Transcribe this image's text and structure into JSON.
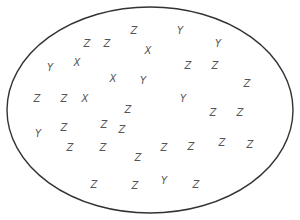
{
  "diagram": {
    "type": "set-ellipse",
    "ellipse": {
      "cx": 150,
      "cy": 110,
      "rx": 143,
      "ry": 103,
      "stroke": "#333333"
    },
    "letter_color": "#555555",
    "letters": [
      {
        "t": "Z",
        "x": 134,
        "y": 31
      },
      {
        "t": "Y",
        "x": 180,
        "y": 31
      },
      {
        "t": "Z",
        "x": 87,
        "y": 44
      },
      {
        "t": "Z",
        "x": 107,
        "y": 44
      },
      {
        "t": "X",
        "x": 148,
        "y": 51
      },
      {
        "t": "Y",
        "x": 218,
        "y": 44
      },
      {
        "t": "Y",
        "x": 50,
        "y": 68
      },
      {
        "t": "X",
        "x": 77,
        "y": 63
      },
      {
        "t": "Z",
        "x": 188,
        "y": 66
      },
      {
        "t": "Z",
        "x": 215,
        "y": 66
      },
      {
        "t": "X",
        "x": 113,
        "y": 79
      },
      {
        "t": "Y",
        "x": 143,
        "y": 81
      },
      {
        "t": "Z",
        "x": 247,
        "y": 84
      },
      {
        "t": "Z",
        "x": 37,
        "y": 99
      },
      {
        "t": "Z",
        "x": 64,
        "y": 99
      },
      {
        "t": "X",
        "x": 85,
        "y": 99
      },
      {
        "t": "Y",
        "x": 183,
        "y": 99
      },
      {
        "t": "Z",
        "x": 128,
        "y": 110
      },
      {
        "t": "Z",
        "x": 213,
        "y": 113
      },
      {
        "t": "Z",
        "x": 240,
        "y": 113
      },
      {
        "t": "Y",
        "x": 38,
        "y": 134
      },
      {
        "t": "Z",
        "x": 64,
        "y": 128
      },
      {
        "t": "Z",
        "x": 104,
        "y": 125
      },
      {
        "t": "Z",
        "x": 122,
        "y": 130
      },
      {
        "t": "Z",
        "x": 70,
        "y": 148
      },
      {
        "t": "Z",
        "x": 103,
        "y": 148
      },
      {
        "t": "Z",
        "x": 138,
        "y": 158
      },
      {
        "t": "Z",
        "x": 164,
        "y": 148
      },
      {
        "t": "Z",
        "x": 191,
        "y": 147
      },
      {
        "t": "Z",
        "x": 222,
        "y": 143
      },
      {
        "t": "Z",
        "x": 250,
        "y": 145
      },
      {
        "t": "Z",
        "x": 94,
        "y": 185
      },
      {
        "t": "Z",
        "x": 135,
        "y": 186
      },
      {
        "t": "Y",
        "x": 164,
        "y": 181
      },
      {
        "t": "Z",
        "x": 196,
        "y": 185
      }
    ]
  }
}
